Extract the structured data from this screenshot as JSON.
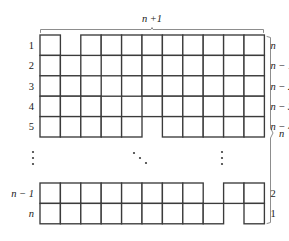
{
  "figure": {
    "name": "staircase-young-diagram",
    "top_brace_label": "n +1",
    "right_brace_label": "n",
    "left_labels": [
      "1",
      "2",
      "3",
      "4",
      "5",
      "n − 1",
      "n"
    ],
    "right_labels": [
      "n",
      "n − 1",
      "n − 2",
      "n − 3",
      "n − 4",
      "2",
      "1"
    ],
    "ellipsis": {
      "left": "⋮",
      "center": "⋰",
      "right": "⋮"
    },
    "colors": {
      "cell_stroke": "#3b3b3b",
      "cell_fill": "#ffffff",
      "brace": "#8d8d8d",
      "text": "#1a1a1a",
      "background": "#ffffff"
    }
  },
  "chart_data": {
    "type": "table",
    "title": "n +1",
    "xlabel": "n +1",
    "ylabel": "n",
    "total_columns": 11,
    "total_rows": 7,
    "cell_size": 20.4,
    "grid_origin": {
      "x": 40,
      "y": 35
    },
    "rows": [
      {
        "left_label": "1",
        "right_label": "n",
        "y": 35.0,
        "left_cells": 1,
        "gap_start": 1,
        "gap_cells": 1,
        "right_cells": 9,
        "visible": true
      },
      {
        "left_label": "2",
        "right_label": "n − 1",
        "y": 55.4,
        "left_cells": 2,
        "gap_start": 2,
        "gap_cells": 1,
        "right_cells": 8,
        "visible": true
      },
      {
        "left_label": "3",
        "right_label": "n − 2",
        "y": 75.8,
        "left_cells": 3,
        "gap_start": 3,
        "gap_cells": 1,
        "right_cells": 7,
        "visible": true
      },
      {
        "left_label": "4",
        "right_label": "n − 3",
        "y": 96.2,
        "left_cells": 4,
        "gap_start": 4,
        "gap_cells": 1,
        "right_cells": 6,
        "visible": true
      },
      {
        "left_label": "5",
        "right_label": "n − 4",
        "y": 116.6,
        "left_cells": 5,
        "gap_start": 5,
        "gap_cells": 1,
        "right_cells": 5,
        "visible": true
      },
      {
        "left_label": "n − 1",
        "right_label": "2",
        "y": 183.0,
        "left_cells": 8,
        "gap_start": 8,
        "gap_cells": 1,
        "right_cells": 2,
        "visible": true
      },
      {
        "left_label": "n",
        "right_label": "1",
        "y": 203.4,
        "left_cells": 9,
        "gap_start": 9,
        "gap_cells": 1,
        "right_cells": 1,
        "visible": true
      }
    ],
    "ellipsis_rows": {
      "y": 158,
      "left_x": 32,
      "center_x": 140,
      "right_x": 222
    },
    "top_brace": {
      "x1": 40,
      "x2": 264,
      "y": 29,
      "label": "n +1",
      "label_x": 152,
      "label_y": 18
    },
    "right_brace": {
      "x": 270,
      "y1": 36,
      "y2": 224,
      "label": "n",
      "label_x": 280,
      "label_y": 133
    }
  }
}
